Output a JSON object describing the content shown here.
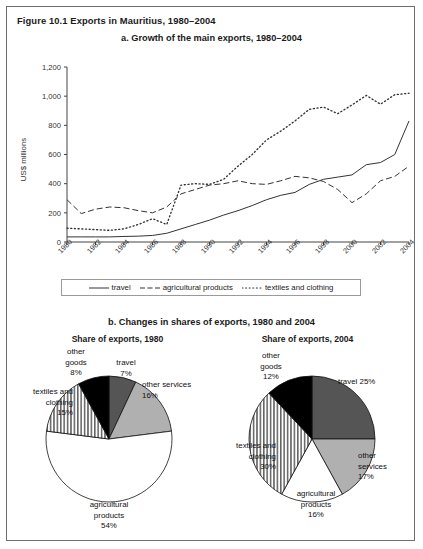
{
  "figure": {
    "title": "Figure 10.1  Exports in Mauritius, 1980–2004",
    "panel_a_title": "a. Growth of the main exports, 1980–2004",
    "panel_b_title": "b. Changes in shares of exports, 1980 and 2004"
  },
  "panel_a": {
    "ylabel": "US$ millions",
    "yticks": [
      "1,200",
      "1,000",
      "800",
      "600",
      "400",
      "200",
      "0"
    ],
    "xticks": [
      "1980",
      "1982",
      "1984",
      "1986",
      "1988",
      "1990",
      "1992",
      "1994",
      "1996",
      "1998",
      "2000",
      "2002",
      "2004"
    ],
    "legend": [
      {
        "label": "travel",
        "key": "solid-line"
      },
      {
        "label": "agricultural products",
        "key": "dashed-line"
      },
      {
        "label": "textiles and clothing",
        "key": "dotted-line"
      }
    ]
  },
  "panel_b": {
    "left_heading": "Share of exports, 1980",
    "right_heading": "Share of exports, 2004",
    "left_labels": {
      "other_goods": "other\ngoods\n8%",
      "travel": "travel\n7%",
      "other_services": "other services\n16%",
      "agricultural": "agricultural\nproducts\n54%",
      "textiles": "textiles and\nclothing\n15%"
    },
    "right_labels": {
      "other_goods": "other\ngoods\n12%",
      "travel": "travel 25%",
      "other_services": "other\nservices\n17%",
      "agricultural": "agricultural\nproducts\n16%",
      "textiles": "textiles and\nclothing\n30%"
    }
  },
  "colors": {
    "ink": "#1a1a1a",
    "axis": "#444444",
    "border": "#6e6e6e",
    "slice_dark_gray": "#555555",
    "slice_light_gray": "#b0b0b0",
    "slice_black": "#000000",
    "slice_white": "#ffffff"
  },
  "chart_data": [
    {
      "type": "line",
      "title": "a. Growth of the main exports, 1980–2004",
      "xlabel": "",
      "ylabel": "US$ millions",
      "ylim": [
        0,
        1200
      ],
      "xlim": [
        1980,
        2004
      ],
      "grid": false,
      "legend_position": "bottom",
      "x": [
        1980,
        1981,
        1982,
        1983,
        1984,
        1985,
        1986,
        1987,
        1988,
        1989,
        1990,
        1991,
        1992,
        1993,
        1994,
        1995,
        1996,
        1997,
        1998,
        1999,
        2000,
        2001,
        2002,
        2003,
        2004
      ],
      "series": [
        {
          "name": "travel",
          "style": "solid",
          "values": [
            35,
            35,
            35,
            35,
            38,
            40,
            45,
            60,
            90,
            120,
            150,
            185,
            215,
            250,
            290,
            320,
            340,
            395,
            430,
            445,
            460,
            530,
            545,
            600,
            830
          ]
        },
        {
          "name": "agricultural products",
          "style": "dashed",
          "values": [
            290,
            195,
            225,
            240,
            235,
            215,
            200,
            240,
            330,
            360,
            390,
            400,
            420,
            400,
            395,
            420,
            450,
            440,
            415,
            360,
            270,
            330,
            420,
            450,
            520
          ]
        },
        {
          "name": "textiles and clothing",
          "style": "dotted",
          "values": [
            95,
            90,
            85,
            80,
            90,
            120,
            160,
            120,
            390,
            400,
            395,
            430,
            520,
            600,
            700,
            760,
            830,
            910,
            925,
            880,
            940,
            1005,
            945,
            1010,
            1020
          ]
        }
      ]
    },
    {
      "type": "pie",
      "title": "Share of exports, 1980",
      "categories": [
        "travel",
        "other services",
        "agricultural products",
        "textiles and clothing",
        "other goods"
      ],
      "values": [
        7,
        16,
        54,
        15,
        8
      ]
    },
    {
      "type": "pie",
      "title": "Share of exports, 2004",
      "categories": [
        "travel",
        "other services",
        "agricultural products",
        "textiles and clothing",
        "other goods"
      ],
      "values": [
        25,
        17,
        16,
        30,
        12
      ]
    }
  ]
}
